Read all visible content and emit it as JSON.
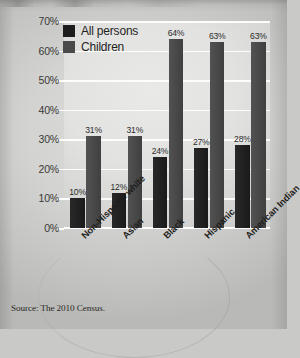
{
  "chart_data": {
    "type": "bar",
    "title": "",
    "subtitle": "",
    "xlabel": "",
    "ylabel": "",
    "categories": [
      "Non-Hispanic white",
      "Asian",
      "Black",
      "Hispanic",
      "American Indian"
    ],
    "series": [
      {
        "name": "All persons",
        "values": [
          10,
          12,
          24,
          27,
          28
        ],
        "color": "#1d1d1d"
      },
      {
        "name": "Children",
        "values": [
          31,
          31,
          64,
          63,
          63
        ],
        "color": "#4a4a4a"
      }
    ],
    "value_labels": [
      [
        "10%",
        "12%",
        "24%",
        "27%",
        "28%"
      ],
      [
        "31%",
        "31%",
        "64%",
        "63%",
        "63%"
      ]
    ],
    "ylim": [
      0,
      70
    ],
    "ytick_values": [
      0,
      10,
      20,
      30,
      40,
      50,
      60,
      70
    ],
    "ytick_labels": [
      "0%",
      "10%",
      "20%",
      "30%",
      "40%",
      "50%",
      "60%",
      "70%"
    ],
    "grid": true,
    "legend_position": "top-left",
    "value_label_suffix": "%"
  },
  "legend": {
    "items": [
      {
        "label": "All persons",
        "color": "#1d1d1d"
      },
      {
        "label": "Children",
        "color": "#4a4a4a"
      }
    ]
  },
  "footer": {
    "source": "Source: The 2010 Census."
  }
}
